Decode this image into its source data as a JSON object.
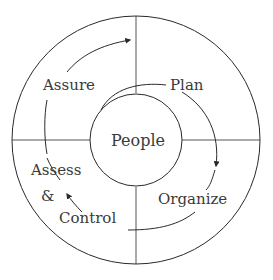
{
  "diagram": {
    "center_label": "People",
    "stages": [
      {
        "label": "Plan"
      },
      {
        "label": "Organize"
      },
      {
        "label": "Assess"
      },
      {
        "label": "&"
      },
      {
        "label": "Control"
      },
      {
        "label": "Assure"
      }
    ],
    "colors": {
      "stroke": "#2a2a2a",
      "text": "#3a3a3a",
      "background": "#ffffff"
    }
  }
}
